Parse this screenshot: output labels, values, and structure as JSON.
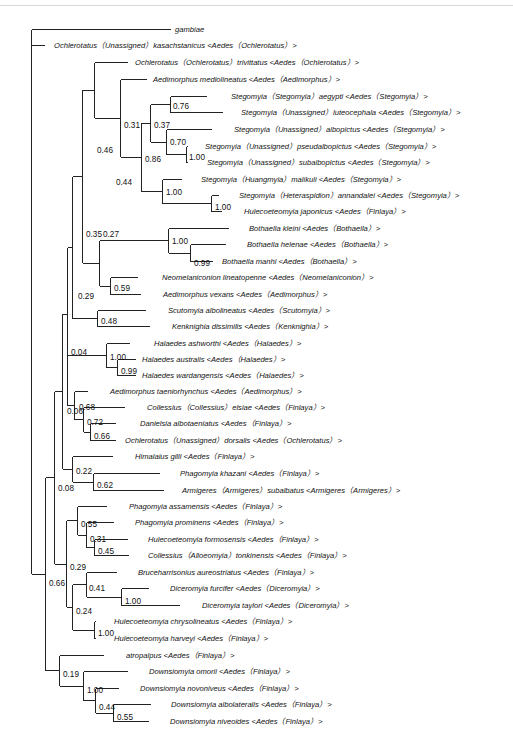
{
  "figure": {
    "type": "phylogenetic-tree",
    "tips": [
      {
        "id": "t0",
        "label": "gambiae",
        "x": 170,
        "y": 32
      },
      {
        "id": "t1",
        "label": "Ochlerotatus（Unassigned）kasachstanicus <Aedes（Ochlerotatus）>",
        "x": 44,
        "y": 48
      },
      {
        "id": "t2",
        "label": "Ochlerotatus（Ochlerotatus）trivittatus <Aedes（Ochlerotatus）>",
        "x": 127,
        "y": 65
      },
      {
        "id": "t3",
        "label": "Aedimorphus mediolineatus <Aedes（Aedimorphus）>",
        "x": 146,
        "y": 82
      },
      {
        "id": "t4",
        "label": "Stegomyia（Stegomyia）aegypti <Aedes（Stegomyia）>",
        "x": 206,
        "y": 99
      },
      {
        "id": "t5",
        "label": "Stegomyia（Unassigned）luteocephala <Aedes（Stegomyia）>",
        "x": 222,
        "y": 115
      },
      {
        "id": "t6",
        "label": "Stegomyia（Unassigned）albopictus <Aedes（Stegomyia）>",
        "x": 211,
        "y": 132
      },
      {
        "id": "t7",
        "label": "Stegomyia（Unassigned）pseudalbopictus <Aedes（Stegomyia）>",
        "x": 187,
        "y": 149
      },
      {
        "id": "t8",
        "label": "Stegomyia（Unassigned）subalbopictus <Aedes（Stegomyia）>",
        "x": 187,
        "y": 165
      },
      {
        "id": "t9",
        "label": "Stegomyia（Huangmyia）malikuli <Aedes（Stegomyia）>",
        "x": 181,
        "y": 182
      },
      {
        "id": "t10",
        "label": "Stegomyia（Heteraspidion）annandalei <Aedes（Stegomyia）>",
        "x": 218,
        "y": 198
      },
      {
        "id": "t11",
        "label": "Hulecoeteomyia japonicus <Aedes（Finlaya）>",
        "x": 221,
        "y": 214
      },
      {
        "id": "t12",
        "label": "Bothaella kleini <Aedes（Bothaella）>",
        "x": 228,
        "y": 231
      },
      {
        "id": "t13",
        "label": "Bothaella helenae <Aedes（Bothaella）>",
        "x": 225,
        "y": 247
      },
      {
        "id": "t14",
        "label": "Bothaella manhi <Aedes（Bothaella）>",
        "x": 212,
        "y": 264
      },
      {
        "id": "t15",
        "label": "Neomelaniconion lineatopenne <Aedes（Neomelaniconion）>",
        "x": 137,
        "y": 280
      },
      {
        "id": "t16",
        "label": "Aedimorphus vexans <Aedes（Aedimorphus）>",
        "x": 140,
        "y": 297
      },
      {
        "id": "t17",
        "label": "Scutomyia albolineatus <Aedes（Scutomyia）>",
        "x": 145,
        "y": 313
      },
      {
        "id": "t18",
        "label": "Kenknighia dissimilis <Aedes（Kenknighia）>",
        "x": 149,
        "y": 329
      },
      {
        "id": "t19",
        "label": "Halaedes ashworthi <Aedes（Halaedes）>",
        "x": 129,
        "y": 346
      },
      {
        "id": "t20",
        "label": "Halaedes australis <Aedes（Halaedes）>",
        "x": 135,
        "y": 362
      },
      {
        "id": "t21",
        "label": "Halaedes wardangensis <Aedes（Halaedes）>",
        "x": 135,
        "y": 378
      },
      {
        "id": "t22",
        "label": "Aedimorphus taeniorhynchus <Aedes（Aedimorphus）>",
        "x": 87,
        "y": 394
      },
      {
        "id": "t23",
        "label": "Collessius（Collessius）elsiae <Aedes（Finlaya）>",
        "x": 124,
        "y": 410
      },
      {
        "id": "t24",
        "label": "Danielsia albotaeniatus <Aedes（Finlaya）>",
        "x": 115,
        "y": 426
      },
      {
        "id": "t25",
        "label": "Ochlerotatus（Unassigned）dorsalis <Aedes（Ochlerotatus）>",
        "x": 115,
        "y": 443
      },
      {
        "id": "t26",
        "label": "Himalaius gilli <Aedes（Finlaya）>",
        "x": 112,
        "y": 459
      },
      {
        "id": "t27",
        "label": "Phagomyia khazani <Aedes（Finlaya）>",
        "x": 159,
        "y": 476
      },
      {
        "id": "t28",
        "label": "Armigeres（Armigeres）subalbatus <Armigeres（Armigeres）>",
        "x": 163,
        "y": 493
      },
      {
        "id": "t29",
        "label": "Phagomyia assamensis <Aedes（Finlaya）>",
        "x": 106,
        "y": 509
      },
      {
        "id": "t30",
        "label": "Phagomyia prominens <Aedes（Finlaya）>",
        "x": 113,
        "y": 525
      },
      {
        "id": "t31",
        "label": "Hulecoeteomyia formosensis <Aedes（Finlaya）>",
        "x": 127,
        "y": 542
      },
      {
        "id": "t32",
        "label": "Collessius（Alloeomyia）tonkinensis <Aedes（Finlaya）>",
        "x": 128,
        "y": 558
      },
      {
        "id": "t33",
        "label": "Bruceharrisonius aureostriatus <Aedes（Finlaya）>",
        "x": 116,
        "y": 575
      },
      {
        "id": "t34",
        "label": "Diceromyia furcifer <Aedes（Diceromyia）>",
        "x": 148,
        "y": 591
      },
      {
        "id": "t35",
        "label": "Diceromyia taylori <Aedes（Diceromyia）>",
        "x": 179,
        "y": 608
      },
      {
        "id": "t36",
        "label": "Hulecoeteomyia chrysolineatus <Aedes（Finlaya）>",
        "x": 95,
        "y": 624
      },
      {
        "id": "t37",
        "label": "Hulecoeteomyia harveyi <Aedes（Finlaya）>",
        "x": 95,
        "y": 641
      },
      {
        "id": "t38",
        "label": "atropalpus <Aedes（Finlaya）>",
        "x": 103,
        "y": 658
      },
      {
        "id": "t39",
        "label": "Downsiomyia omorii <Aedes（Finlaya）>",
        "x": 127,
        "y": 674
      },
      {
        "id": "t40",
        "label": "Downsiomyia novoniveus <Aedes（Finlaya）>",
        "x": 118,
        "y": 691
      },
      {
        "id": "t41",
        "label": "Downsiomyia albolateralis <Aedes（Finlaya）>",
        "x": 150,
        "y": 707
      },
      {
        "id": "t42",
        "label": "Downsiomyia niveoides <Aedes（Finlaya）>",
        "x": 148,
        "y": 724
      }
    ],
    "nodes": [
      {
        "id": "root",
        "x": 31,
        "children": [
          "t0",
          "t1",
          "n66"
        ],
        "support": ""
      },
      {
        "id": "n66",
        "x": 45,
        "children": [
          "n08",
          "n19"
        ],
        "support": "0.66"
      },
      {
        "id": "n08",
        "x": 54,
        "children": [
          "n04",
          "n29b"
        ],
        "support": "0.08"
      },
      {
        "id": "n04",
        "x": 62,
        "children": [
          "n29",
          "n06"
        ],
        "support": "0.04"
      },
      {
        "id": "n29",
        "x": 67,
        "children": [
          "n35",
          "n4448"
        ],
        "support": "0.29"
      },
      {
        "id": "n35",
        "x": 82,
        "children": [
          "n46",
          "n27"
        ],
        "support": "0.35"
      },
      {
        "id": "n46",
        "x": 94,
        "children": [
          "t2",
          "n31"
        ],
        "support": "0.46"
      },
      {
        "id": "n31",
        "x": 120,
        "children": [
          "t3",
          "n86"
        ],
        "support": "0.31"
      },
      {
        "id": "n86",
        "x": 141,
        "children": [
          "n37",
          "n100a"
        ],
        "support": "0.86"
      },
      {
        "id": "n37",
        "x": 150,
        "children": [
          "n76",
          "n70"
        ],
        "support": "0.37"
      },
      {
        "id": "n76",
        "x": 170,
        "children": [
          "t4",
          "t5"
        ],
        "support": "0.76"
      },
      {
        "id": "n70",
        "x": 166,
        "children": [
          "t6",
          "n100b"
        ],
        "support": "0.70"
      },
      {
        "id": "n100b",
        "x": 186,
        "children": [
          "t7",
          "t8"
        ],
        "support": "1.00"
      },
      {
        "id": "n100a",
        "x": 162,
        "children": [
          "t9",
          "n100c"
        ],
        "support": "1.00"
      },
      {
        "id": "n100c",
        "x": 211,
        "children": [
          "t10",
          "t11"
        ],
        "support": "1.00"
      },
      {
        "id": "n27",
        "x": 99,
        "children": [
          "n100d",
          "n59"
        ],
        "support": "0.27"
      },
      {
        "id": "n100d",
        "x": 168,
        "children": [
          "t12",
          "n99a"
        ],
        "support": "1.00"
      },
      {
        "id": "n99a",
        "x": 190,
        "children": [
          "t13",
          "t14"
        ],
        "support": "0.99"
      },
      {
        "id": "n59",
        "x": 110,
        "children": [
          "t15",
          "t16"
        ],
        "support": "0.59"
      },
      {
        "id": "n4448",
        "x": 82,
        "children": [
          "n48"
        ],
        "support": ""
      },
      {
        "id": "n48",
        "x": 97,
        "children": [
          "t17",
          "t18"
        ],
        "support": "0.48"
      },
      {
        "id": "n100e",
        "x": 106,
        "children": [
          "t19",
          "n99b"
        ],
        "support": "1.00"
      },
      {
        "id": "n99b",
        "x": 117,
        "children": [
          "t20",
          "t21"
        ],
        "support": "0.99"
      },
      {
        "id": "n06",
        "x": 67,
        "children": [
          "n68"
        ],
        "support": "0.06"
      },
      {
        "id": "n68",
        "x": 74,
        "children": [
          "t22",
          "n72"
        ],
        "support": "0.68"
      },
      {
        "id": "n72",
        "x": 83,
        "children": [
          "t23",
          "n66b"
        ],
        "support": "0.72"
      },
      {
        "id": "n66b",
        "x": 90,
        "children": [
          "t24",
          "t25"
        ],
        "support": "0.66"
      },
      {
        "id": "n22",
        "x": 72,
        "children": [
          "t26",
          "n62"
        ],
        "support": "0.22"
      },
      {
        "id": "n62",
        "x": 93,
        "children": [
          "t27",
          "t28"
        ],
        "support": "0.62"
      },
      {
        "id": "n29b",
        "x": 66,
        "children": [
          "n55",
          "n24"
        ],
        "support": "0.29"
      },
      {
        "id": "n55",
        "x": 77,
        "children": [
          "t29",
          "n31b"
        ],
        "support": "0.55"
      },
      {
        "id": "n31b",
        "x": 86,
        "children": [
          "t30",
          "n45"
        ],
        "support": "0.31"
      },
      {
        "id": "n45",
        "x": 94,
        "children": [
          "t31",
          "t32"
        ],
        "support": "0.45"
      },
      {
        "id": "n24",
        "x": 72,
        "children": [
          "n41",
          "n100f"
        ],
        "support": "0.24"
      },
      {
        "id": "n41",
        "x": 86,
        "children": [
          "t33",
          "n100g"
        ],
        "support": "0.41"
      },
      {
        "id": "n100g",
        "x": 121,
        "children": [
          "t34",
          "t35"
        ],
        "support": "1.00"
      },
      {
        "id": "n100f",
        "x": 94,
        "children": [
          "t36",
          "t37"
        ],
        "support": "1.00"
      },
      {
        "id": "n19",
        "x": 59,
        "children": [
          "t38",
          "n100h"
        ],
        "support": "0.19"
      },
      {
        "id": "n100h",
        "x": 83,
        "children": [
          "t39",
          "n44"
        ],
        "support": "1.00"
      },
      {
        "id": "n44",
        "x": 95,
        "children": [
          "t40",
          "n55b"
        ],
        "support": "0.44"
      },
      {
        "id": "n55b",
        "x": 113,
        "children": [
          "t41",
          "t42"
        ],
        "support": "0.55"
      }
    ],
    "support_labels": [
      {
        "text": "0.76",
        "x": 173,
        "y": 109
      },
      {
        "text": "0.31",
        "x": 124,
        "y": 128
      },
      {
        "text": "0.37",
        "x": 154,
        "y": 128
      },
      {
        "text": "0.46",
        "x": 97,
        "y": 153
      },
      {
        "text": "0.70",
        "x": 170,
        "y": 145
      },
      {
        "text": "1.00",
        "x": 189,
        "y": 160
      },
      {
        "text": "0.86",
        "x": 145,
        "y": 162
      },
      {
        "text": "0.44",
        "x": 116,
        "y": 185
      },
      {
        "text": "1.00",
        "x": 166,
        "y": 195
      },
      {
        "text": "1.00",
        "x": 215,
        "y": 210
      },
      {
        "text": "0.35",
        "x": 86,
        "y": 237
      },
      {
        "text": "0.27",
        "x": 103,
        "y": 237
      },
      {
        "text": "1.00",
        "x": 172,
        "y": 244
      },
      {
        "text": "0.99",
        "x": 194,
        "y": 266
      },
      {
        "text": "0.59",
        "x": 114,
        "y": 291
      },
      {
        "text": "0.29",
        "x": 78,
        "y": 299
      },
      {
        "text": "0.48",
        "x": 101,
        "y": 324
      },
      {
        "text": "0.04",
        "x": 71,
        "y": 355
      },
      {
        "text": "1.00",
        "x": 110,
        "y": 360
      },
      {
        "text": "0.99",
        "x": 121,
        "y": 374
      },
      {
        "text": "0.06",
        "x": 67,
        "y": 414
      },
      {
        "text": "0.68",
        "x": 79,
        "y": 410
      },
      {
        "text": "0.72",
        "x": 87,
        "y": 425
      },
      {
        "text": "0.66",
        "x": 94,
        "y": 439
      },
      {
        "text": "0.22",
        "x": 76,
        "y": 474
      },
      {
        "text": "0.62",
        "x": 97,
        "y": 488
      },
      {
        "text": "0.08",
        "x": 58,
        "y": 491
      },
      {
        "text": "0.55",
        "x": 81,
        "y": 527
      },
      {
        "text": "0.31",
        "x": 90,
        "y": 542
      },
      {
        "text": "0.45",
        "x": 98,
        "y": 554
      },
      {
        "text": "0.29",
        "x": 70,
        "y": 570
      },
      {
        "text": "0.66",
        "x": 49,
        "y": 586
      },
      {
        "text": "0.41",
        "x": 89,
        "y": 591
      },
      {
        "text": "1.00",
        "x": 125,
        "y": 604
      },
      {
        "text": "0.24",
        "x": 76,
        "y": 614
      },
      {
        "text": "1.00",
        "x": 98,
        "y": 636
      },
      {
        "text": "0.19",
        "x": 63,
        "y": 677
      },
      {
        "text": "1.00",
        "x": 87,
        "y": 693
      },
      {
        "text": "0.44",
        "x": 99,
        "y": 710
      },
      {
        "text": "0.55",
        "x": 117,
        "y": 720
      }
    ]
  }
}
